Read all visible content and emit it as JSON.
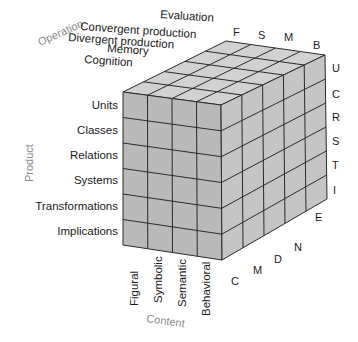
{
  "diagram": {
    "axes": {
      "operation": {
        "label": "Operation",
        "items": [
          "Evaluation",
          "Convergent production",
          "Divergent production",
          "Memory",
          "Cognition"
        ],
        "letters": [
          "F",
          "S",
          "M",
          "B"
        ]
      },
      "product": {
        "label": "Product",
        "items": [
          "Units",
          "Classes",
          "Relations",
          "Systems",
          "Transformations",
          "Implications"
        ],
        "letters": [
          "U",
          "C",
          "R",
          "S",
          "T",
          "I"
        ]
      },
      "content": {
        "label": "Content",
        "items": [
          "Figural",
          "Symbolic",
          "Semantic",
          "Behavioral"
        ],
        "letters": [
          "C",
          "M",
          "D",
          "N",
          "E"
        ]
      }
    },
    "colors": {
      "front_face": "#b9b9b9",
      "top_face": "#d2d2d2",
      "side_face": "#c5c5c5",
      "grid_line": "#2a2a2a",
      "axis_label": "#8a8a8a"
    }
  }
}
